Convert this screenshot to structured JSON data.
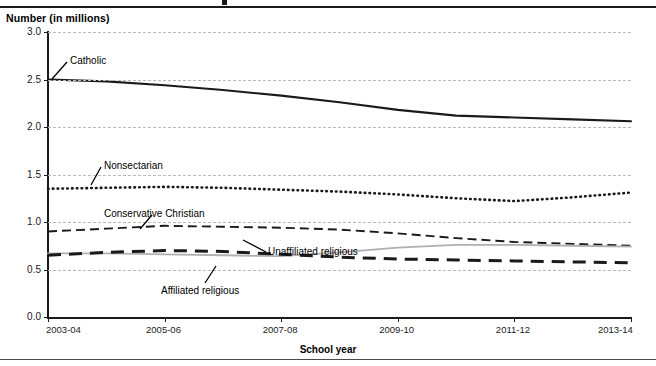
{
  "figure": {
    "y_axis_title": "Number (in millions)",
    "x_axis_title": "School year"
  },
  "axes": {
    "y_ticks": [
      "0.0",
      "0.5",
      "1.0",
      "1.5",
      "2.0",
      "2.5",
      "3.0"
    ],
    "x_ticks": [
      "2003-04",
      "2005-06",
      "2007-08",
      "2009-10",
      "2011-12",
      "2013-14"
    ]
  },
  "annotations": [
    {
      "label": "Catholic"
    },
    {
      "label": "Nonsectarian"
    },
    {
      "label": "Conservative Christian"
    },
    {
      "label": "Unaffiliated religious"
    },
    {
      "label": "Affiliated religious"
    }
  ],
  "colors": {
    "catholic": "#1a1a1a",
    "nonsectarian": "#1a1a1a",
    "conservative_christian": "#1a1a1a",
    "unaffiliated_religious": "#b0b0b0",
    "affiliated_religious": "#1a1a1a",
    "gridline": "#b9b9b9",
    "axis": "#1a1a1a"
  },
  "chart_data": {
    "type": "line",
    "title": "",
    "xlabel": "School year",
    "ylabel": "Number (in millions)",
    "ylim": [
      0.0,
      3.0
    ],
    "ytick_values": [
      0.0,
      0.5,
      1.0,
      1.5,
      2.0,
      2.5,
      3.0
    ],
    "grid": true,
    "legend": "inline-annotations",
    "categories": [
      "2003-04",
      "2004-05",
      "2005-06",
      "2006-07",
      "2007-08",
      "2008-09",
      "2009-10",
      "2010-11",
      "2011-12",
      "2012-13",
      "2013-14"
    ],
    "series": [
      {
        "name": "Catholic",
        "style": "solid",
        "values": [
          2.5,
          2.48,
          2.44,
          2.39,
          2.33,
          2.26,
          2.18,
          2.12,
          2.1,
          2.08,
          2.06
        ]
      },
      {
        "name": "Nonsectarian",
        "style": "dotted",
        "values": [
          1.35,
          1.36,
          1.37,
          1.36,
          1.34,
          1.32,
          1.29,
          1.25,
          1.22,
          1.26,
          1.31
        ]
      },
      {
        "name": "Conservative Christian",
        "style": "dashed",
        "values": [
          0.9,
          0.93,
          0.96,
          0.95,
          0.94,
          0.92,
          0.88,
          0.83,
          0.79,
          0.77,
          0.75
        ]
      },
      {
        "name": "Unaffiliated religious",
        "style": "solid-gray",
        "values": [
          0.67,
          0.67,
          0.66,
          0.65,
          0.64,
          0.68,
          0.73,
          0.76,
          0.76,
          0.75,
          0.74
        ]
      },
      {
        "name": "Affiliated religious",
        "style": "long-dashed",
        "values": [
          0.65,
          0.68,
          0.7,
          0.69,
          0.66,
          0.63,
          0.61,
          0.6,
          0.59,
          0.58,
          0.57
        ]
      }
    ]
  }
}
